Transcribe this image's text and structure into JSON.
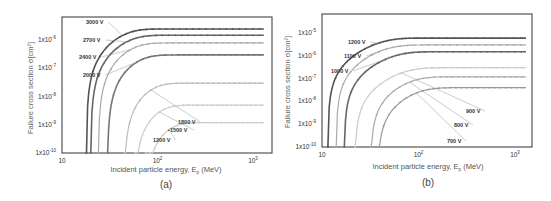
{
  "chart_data": [
    {
      "panel": "(a)",
      "type": "line",
      "title": "",
      "xlabel": "Incident particle energy, E_p (MeV)",
      "ylabel": "Failure cross section σ[cm²]",
      "xscale": "log",
      "yscale": "log",
      "xlim": [
        10,
        1300
      ],
      "ylim": [
        1e-10,
        6e-06
      ],
      "x_ticks": [
        "10",
        "10²",
        "10³"
      ],
      "y_ticks": [
        "1x10⁻¹⁰",
        "1x10⁻⁹",
        "1x10⁻⁸",
        "1x10⁻⁷",
        "1x10⁻⁶"
      ],
      "grid": false,
      "legend": "inline labels with leader lines",
      "series": [
        {
          "name": "3000 V",
          "color": "#555555",
          "onset": 18,
          "saturation": 2.5e-06,
          "knee": 45
        },
        {
          "name": "2700 V",
          "color": "#666666",
          "onset": 20,
          "saturation": 1.5e-06,
          "knee": 50
        },
        {
          "name": "2400 V",
          "color": "#aaaaaa",
          "onset": 24,
          "saturation": 8e-07,
          "knee": 55
        },
        {
          "name": "2000 V",
          "color": "#777777",
          "onset": 30,
          "saturation": 3e-07,
          "knee": 65
        },
        {
          "name": "1800 V",
          "color": "#bbbbbb",
          "onset": 45,
          "saturation": 3e-08,
          "knee": 90
        },
        {
          "name": "1500 V",
          "color": "#cccccc",
          "onset": 58,
          "saturation": 5e-09,
          "knee": 110
        },
        {
          "name": "1200 V",
          "color": "#cccccc",
          "onset": 75,
          "saturation": 1.2e-09,
          "knee": 140
        }
      ]
    },
    {
      "panel": "(b)",
      "type": "line",
      "title": "",
      "xlabel": "Incident particle energy, E_p (MeV)",
      "ylabel": "Failure cross section σ[cm²]",
      "xscale": "log",
      "yscale": "log",
      "xlim": [
        10,
        1300
      ],
      "ylim": [
        1e-10,
        2.5e-05
      ],
      "x_ticks": [
        "10",
        "10²",
        "10³"
      ],
      "y_ticks": [
        "1x10⁻¹⁰",
        "1x10⁻⁹",
        "1x10⁻⁸",
        "1x10⁻⁷",
        "1x10⁻⁶",
        "1x10⁻⁵"
      ],
      "grid": false,
      "legend": "inline labels with leader lines",
      "series": [
        {
          "name": "1200 V",
          "color": "#555555",
          "onset": 11.5,
          "saturation": 6e-06,
          "knee": 40
        },
        {
          "name": "1100 V",
          "color": "#aaaaaa",
          "onset": 14,
          "saturation": 3e-06,
          "knee": 45
        },
        {
          "name": "1000 V",
          "color": "#666666",
          "onset": 17,
          "saturation": 1.5e-06,
          "knee": 55
        },
        {
          "name": "900 V",
          "color": "#cccccc",
          "onset": 22,
          "saturation": 3e-07,
          "knee": 70
        },
        {
          "name": "800 V",
          "color": "#aaaaaa",
          "onset": 32,
          "saturation": 1.2e-07,
          "knee": 85
        },
        {
          "name": "700 V",
          "color": "#999999",
          "onset": 38,
          "saturation": 4e-08,
          "knee": 100
        }
      ]
    }
  ],
  "panels": [
    {
      "caption": "(a)",
      "xlabel": "Incident particle energy, E",
      "xlabel_sub": "p",
      "xlabel_unit": " (MeV)",
      "ylabel": "Failure cross section σ[cm²]",
      "x_tick_labels": [
        {
          "base": "10",
          "sup": ""
        },
        {
          "base": "10",
          "sup": "2"
        },
        {
          "base": "10",
          "sup": "3"
        }
      ],
      "y_tick_labels": [
        {
          "base": "1x10",
          "sup": "-10"
        },
        {
          "base": "1x10",
          "sup": "-9"
        },
        {
          "base": "1x10",
          "sup": "-8"
        },
        {
          "base": "1x10",
          "sup": "-7"
        },
        {
          "base": "1x10",
          "sup": "-6"
        }
      ],
      "labels": [
        {
          "text": "3000 V",
          "x": 86,
          "y": 24
        },
        {
          "text": "2700 V",
          "x": 83,
          "y": 42
        },
        {
          "text": "2400 V",
          "x": 79,
          "y": 59
        },
        {
          "text": "2000 V",
          "x": 83,
          "y": 77
        },
        {
          "text": "1800 V",
          "x": 178,
          "y": 124
        },
        {
          "text": "•1500 V",
          "x": 168,
          "y": 132
        },
        {
          "text": "1200 V",
          "x": 153,
          "y": 142
        }
      ]
    },
    {
      "caption": "(b)",
      "xlabel": "Incident particle energy, E",
      "xlabel_sub": "p",
      "xlabel_unit": " (MeV)",
      "ylabel": "Failure cross section σ[cm²]",
      "x_tick_labels": [
        {
          "base": "10",
          "sup": ""
        },
        {
          "base": "10",
          "sup": "2"
        },
        {
          "base": "10",
          "sup": "3"
        }
      ],
      "y_tick_labels": [
        {
          "base": "1x10",
          "sup": "-10"
        },
        {
          "base": "1x10",
          "sup": "-9"
        },
        {
          "base": "1x10",
          "sup": "-8"
        },
        {
          "base": "1x10",
          "sup": "-7"
        },
        {
          "base": "1x10",
          "sup": "-6"
        },
        {
          "base": "1x10",
          "sup": "-5"
        }
      ],
      "labels": [
        {
          "text": "1200 V",
          "x": 348,
          "y": 44
        },
        {
          "text": "1100 V",
          "x": 344,
          "y": 58
        },
        {
          "text": "1000 V",
          "x": 331,
          "y": 73
        },
        {
          "text": "900 V",
          "x": 466,
          "y": 113
        },
        {
          "text": "800 V",
          "x": 454,
          "y": 127
        },
        {
          "text": "700 V",
          "x": 447,
          "y": 143
        }
      ]
    }
  ]
}
